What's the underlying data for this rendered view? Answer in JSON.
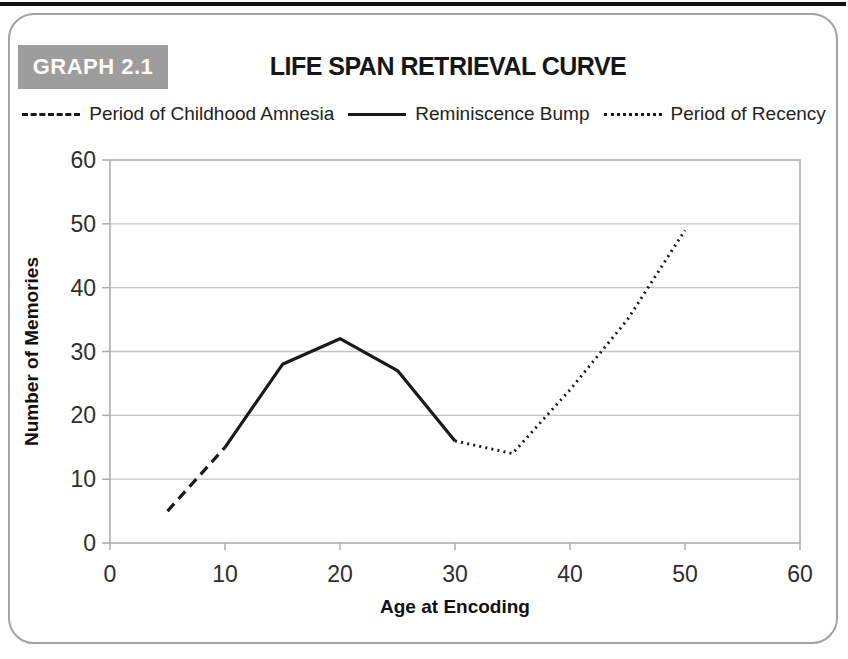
{
  "page": {
    "graph_label": "GRAPH 2.1",
    "title": "LIFE SPAN RETRIEVAL CURVE"
  },
  "legend": [
    {
      "label": "Period of Childhood Amnesia",
      "style": "dashed"
    },
    {
      "label": "Reminiscence Bump",
      "style": "solid"
    },
    {
      "label": "Period of Recency",
      "style": "dotted"
    }
  ],
  "chart_data": {
    "type": "line",
    "title": "LIFE SPAN RETRIEVAL CURVE",
    "xlabel": "Age at Encoding",
    "ylabel": "Number of Memories",
    "xlim": [
      0,
      60
    ],
    "ylim": [
      0,
      60
    ],
    "xticks": [
      0,
      10,
      20,
      30,
      40,
      50,
      60
    ],
    "yticks": [
      0,
      10,
      20,
      30,
      40,
      50,
      60
    ],
    "grid": true,
    "legend_position": "top",
    "series": [
      {
        "name": "Period of Childhood Amnesia",
        "style": "dashed",
        "points": [
          [
            5,
            5
          ],
          [
            10,
            15
          ]
        ]
      },
      {
        "name": "Reminiscence Bump",
        "style": "solid",
        "points": [
          [
            10,
            15
          ],
          [
            15,
            28
          ],
          [
            20,
            32
          ],
          [
            25,
            27
          ],
          [
            30,
            16
          ]
        ]
      },
      {
        "name": "Period of Recency",
        "style": "dotted",
        "points": [
          [
            30,
            16
          ],
          [
            35,
            14
          ],
          [
            40,
            24
          ],
          [
            45,
            35
          ],
          [
            50,
            49
          ]
        ]
      }
    ],
    "colors": {
      "line": "#1a1a1a",
      "grid": "#c4c4c4",
      "axis": "#adadad",
      "badge_bg": "#9d9d9d",
      "badge_text": "#fbfbfb"
    }
  }
}
